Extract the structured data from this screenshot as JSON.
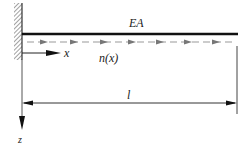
{
  "diagram": {
    "type": "axially loaded bar (cantilever) with distributed axial load",
    "labels": {
      "stiffness": "EA",
      "axis_x": "x",
      "axis_z": "z",
      "load": "n(x)",
      "length": "l"
    },
    "elements": {
      "support": "fixed wall (hatched) at left end",
      "beam": "horizontal bar from wall to right end",
      "distributed_load": "dashed line with right-pointing arrowheads along bar",
      "x_axis": "arrow pointing right from wall",
      "z_axis": "arrow pointing down from wall",
      "dimension": "double-headed arrow spanning bar length"
    },
    "colors": {
      "beam": "#111111",
      "load": "#888888",
      "text": "#222222"
    }
  }
}
